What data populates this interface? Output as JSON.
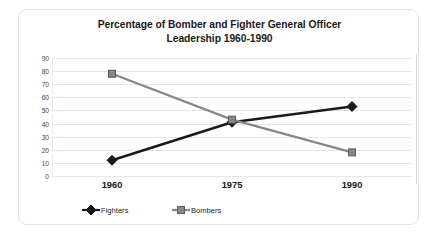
{
  "chart_data": {
    "type": "line",
    "title": "Percentage of Bomber and Fighter General Officer Leadership 1960-1990",
    "title_lines": [
      "Percentage of Bomber and Fighter General Officer",
      "Leadership 1960-1990"
    ],
    "xlabel": "",
    "ylabel": "",
    "categories": [
      "1960",
      "1975",
      "1990"
    ],
    "x": [
      1960,
      1975,
      1990
    ],
    "series": [
      {
        "name": "Fighters",
        "values": [
          12,
          41,
          53
        ],
        "color": "#1a1a1a",
        "marker": "diamond"
      },
      {
        "name": "Bombers",
        "values": [
          78,
          43,
          18
        ],
        "color": "#878787",
        "marker": "square"
      }
    ],
    "ylim": [
      0,
      90
    ],
    "ytick_step": 10,
    "yticks": [
      "90",
      "80",
      "70",
      "60",
      "50",
      "40",
      "30",
      "20",
      "10",
      "0"
    ],
    "grid": true,
    "grid_color": "#e6e6e6",
    "legend_position": "bottom",
    "background": "#ffffff",
    "border_color": "#e3e3e3"
  },
  "legend": {
    "items": [
      {
        "label": "Fighters",
        "color": "#1a1a1a",
        "marker": "diamond"
      },
      {
        "label": "Bombers",
        "color": "#878787",
        "marker": "square"
      }
    ]
  }
}
